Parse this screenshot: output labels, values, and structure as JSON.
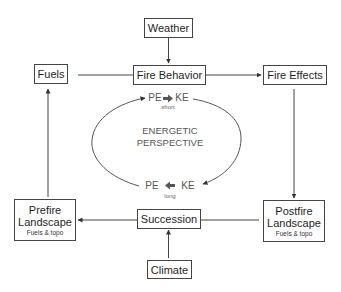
{
  "nodes": {
    "weather": {
      "label": "Weather"
    },
    "fuels": {
      "label": "Fuels"
    },
    "fire_behavior": {
      "label": "Fire Behavior"
    },
    "fire_effects": {
      "label": "Fire Effects"
    },
    "prefire": {
      "label_line1": "Prefire",
      "label_line2": "Landscape",
      "sub": "Fuels & topo"
    },
    "postfire": {
      "label_line1": "Postfire",
      "label_line2": "Landscape",
      "sub": "Fuels & topo"
    },
    "succession": {
      "label": "Succession"
    },
    "climate": {
      "label": "Climate"
    }
  },
  "cycle": {
    "title_line1": "ENERGETIC",
    "title_line2": "PERSPECTIVE",
    "top": {
      "left": "PE",
      "right": "KE",
      "caption": "short"
    },
    "bottom": {
      "left": "PE",
      "right": "KE",
      "caption": "long"
    }
  },
  "colors": {
    "line": "#444444",
    "cycle_text": "#555555"
  }
}
